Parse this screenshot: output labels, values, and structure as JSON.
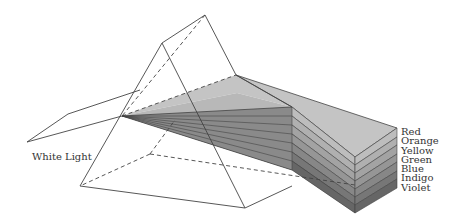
{
  "diagram": {
    "input_label": "White Light",
    "spectrum": [
      {
        "name": "Red",
        "shade": "#bdbdbd"
      },
      {
        "name": "Orange",
        "shade": "#b0b0b0"
      },
      {
        "name": "Yellow",
        "shade": "#a3a3a3"
      },
      {
        "name": "Green",
        "shade": "#969696"
      },
      {
        "name": "Blue",
        "shade": "#878787"
      },
      {
        "name": "Indigo",
        "shade": "#777777"
      },
      {
        "name": "Violet",
        "shade": "#666666"
      }
    ],
    "colors": {
      "line": "#444444",
      "top_face": "#c4c4c4",
      "background": "#ffffff"
    }
  }
}
